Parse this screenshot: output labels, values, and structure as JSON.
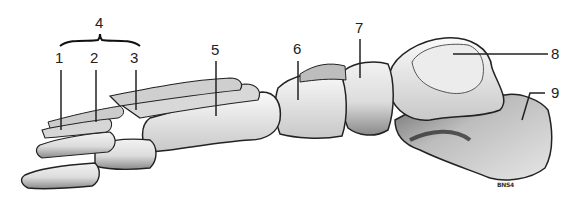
{
  "figure": {
    "labels": [
      {
        "id": "1",
        "text": "1"
      },
      {
        "id": "2",
        "text": "2"
      },
      {
        "id": "3",
        "text": "3"
      },
      {
        "id": "4",
        "text": "4"
      },
      {
        "id": "5",
        "text": "5"
      },
      {
        "id": "6",
        "text": "6"
      },
      {
        "id": "7",
        "text": "7"
      },
      {
        "id": "8",
        "text": "8"
      },
      {
        "id": "9",
        "text": "9"
      }
    ],
    "signature": "BNS4"
  }
}
